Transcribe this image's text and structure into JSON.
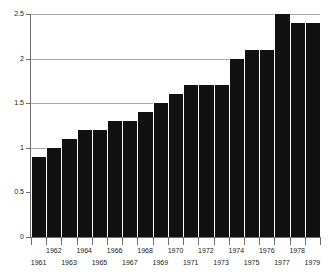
{
  "chart_data": {
    "type": "bar",
    "title": "",
    "xlabel": "",
    "ylabel": "",
    "ylim": [
      0,
      2.5
    ],
    "yticks": [
      "0",
      "0.5",
      "1",
      "1.5",
      "2",
      "2.5"
    ],
    "ytick_values": [
      0,
      0.5,
      1,
      1.5,
      2,
      2.5
    ],
    "grid": true,
    "legend": false,
    "categories": [
      "1961",
      "1962",
      "1963",
      "1964",
      "1965",
      "1966",
      "1967",
      "1968",
      "1969",
      "1970",
      "1971",
      "1972",
      "1973",
      "1974",
      "1975",
      "1976",
      "1977",
      "1978",
      "1979"
    ],
    "values": [
      0.9,
      1.0,
      1.1,
      1.2,
      1.2,
      1.3,
      1.3,
      1.4,
      1.5,
      1.6,
      1.7,
      1.7,
      1.7,
      2.0,
      2.1,
      2.1,
      2.5,
      2.4,
      2.4
    ],
    "bar_color": "#111111",
    "grid_color": "#a9a9a9",
    "axis_color": "#6e6e6e",
    "background_color": "#ffffff"
  }
}
